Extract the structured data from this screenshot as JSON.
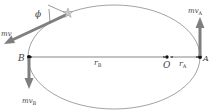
{
  "diagram": {
    "type": "elliptical-orbit",
    "labels": {
      "point_A": "A",
      "point_B": "B",
      "focus_O": "O",
      "radius_A": "r",
      "radius_A_sub": "A",
      "radius_B": "r",
      "radius_B_sub": "B",
      "momentum_A": "mv",
      "momentum_A_sub": "A",
      "momentum_B": "mv",
      "momentum_B_sub": "B",
      "momentum_general": "mv",
      "angle": "ϕ"
    },
    "colors": {
      "orbit": "#8a8a8a",
      "arrow": "#7f7f7f",
      "line": "#555555",
      "point": "#111111",
      "text": "#444444"
    }
  }
}
